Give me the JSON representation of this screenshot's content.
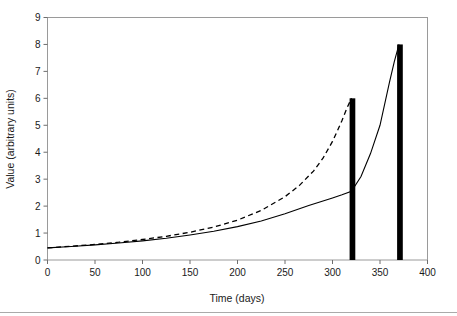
{
  "chart_data": {
    "type": "line",
    "title": "",
    "xlabel": "Time (days)",
    "ylabel": "Value (arbitrary units)",
    "xlim": [
      0,
      400
    ],
    "ylim": [
      0,
      9
    ],
    "xticks": [
      0,
      50,
      100,
      150,
      200,
      250,
      300,
      350,
      400
    ],
    "xtick_labels": [
      "0",
      "50",
      "100",
      "150",
      "200",
      "250",
      "300",
      "350",
      "400"
    ],
    "yticks": [
      0,
      1,
      2,
      3,
      4,
      5,
      6,
      7,
      8,
      9
    ],
    "ytick_labels": [
      "0",
      "1",
      "2",
      "3",
      "4",
      "5",
      "6",
      "7",
      "8",
      "9"
    ],
    "grid": false,
    "legend": "none",
    "series": [
      {
        "name": "solid-curve",
        "style": "solid",
        "color": "#000000",
        "x": [
          0,
          25,
          50,
          75,
          100,
          125,
          150,
          175,
          200,
          225,
          250,
          275,
          300,
          310,
          320,
          330,
          340,
          350,
          360,
          365,
          370
        ],
        "values": [
          0.45,
          0.5,
          0.56,
          0.63,
          0.71,
          0.81,
          0.93,
          1.07,
          1.24,
          1.45,
          1.72,
          2.02,
          2.3,
          2.42,
          2.55,
          3.1,
          3.95,
          5.0,
          6.6,
          7.35,
          8.0
        ]
      },
      {
        "name": "dashed-curve",
        "style": "dashed",
        "color": "#000000",
        "x": [
          0,
          25,
          50,
          75,
          100,
          125,
          150,
          175,
          200,
          225,
          250,
          265,
          280,
          290,
          300,
          305,
          310,
          315,
          318,
          320
        ],
        "values": [
          0.45,
          0.51,
          0.58,
          0.66,
          0.76,
          0.88,
          1.03,
          1.22,
          1.48,
          1.84,
          2.35,
          2.76,
          3.3,
          3.78,
          4.4,
          4.78,
          5.18,
          5.62,
          5.85,
          6.0
        ]
      }
    ],
    "bars": [
      {
        "name": "bar-1",
        "x": 321,
        "value": 6.0,
        "width_days": 6,
        "color": "#000000"
      },
      {
        "name": "bar-2",
        "x": 371,
        "value": 8.0,
        "width_days": 6,
        "color": "#000000"
      }
    ]
  }
}
